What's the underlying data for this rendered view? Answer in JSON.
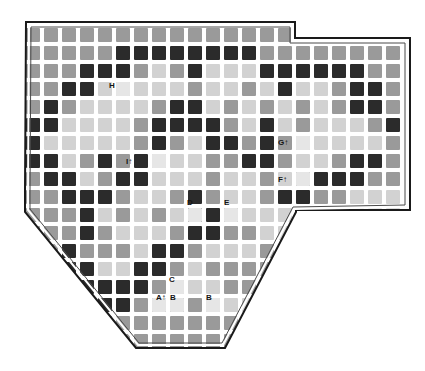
{
  "figure": {
    "name": "grid-map-diagram",
    "type": "checkerboard-grid-map",
    "background": "#ffffff",
    "border_color": "#1a1a1a",
    "cell_pitch": 18,
    "cell_size": 14,
    "origin": {
      "x": 26,
      "y": 28
    },
    "grid_cols": 21,
    "grid_rows": 18
  },
  "palette": {
    "light": "#d2d2d2",
    "medium": "#9a9a9a",
    "dark": "#2b2b2b",
    "void": "#ffffff",
    "label_text": "#151515",
    "outline": "#1a1a1a"
  },
  "legend_tones": [
    {
      "key": "light",
      "label": "light",
      "color": "#d2d2d2"
    },
    {
      "key": "medium",
      "label": "medium",
      "color": "#9a9a9a"
    },
    {
      "key": "dark",
      "label": "dark",
      "color": "#2b2b2b"
    }
  ],
  "boundary": {
    "name": "irregular-polygon-outline",
    "points": "26,22 295,22 295,38 410,38 410,210 296,210 296,212 225,348 136,348 25,212 25,192 26,22",
    "description": "Irregular plate: rectangular top-left block, stepped notch at top-right, diagonal cuts at bottom-left and bottom-right meeting a flat bottom edge."
  },
  "labels": [
    {
      "id": "H",
      "text": "H",
      "arrow": "",
      "col": 5,
      "row": 3,
      "x": 114,
      "y": 86
    },
    {
      "id": "I",
      "text": "I",
      "arrow": "↑",
      "col": 7,
      "row": 7,
      "x": 131,
      "y": 162
    },
    {
      "id": "G",
      "text": "G",
      "arrow": "↑",
      "col": 15,
      "row": 6,
      "x": 283,
      "y": 143
    },
    {
      "id": "F",
      "text": "F",
      "arrow": "↑",
      "col": 15,
      "row": 8,
      "x": 283,
      "y": 180
    },
    {
      "id": "D",
      "text": "D",
      "arrow": "",
      "col": 9,
      "row": 10,
      "x": 192,
      "y": 203
    },
    {
      "id": "E",
      "text": "E",
      "arrow": "",
      "col": 11,
      "row": 10,
      "x": 229,
      "y": 203
    },
    {
      "id": "C",
      "text": "C",
      "arrow": "",
      "col": 8,
      "row": 14,
      "x": 174,
      "y": 280
    },
    {
      "id": "A",
      "text": "A",
      "arrow": "↑",
      "col": 7,
      "row": 15,
      "x": 161,
      "y": 298
    },
    {
      "id": "B1",
      "text": "B",
      "arrow": "",
      "col": 8,
      "row": 15,
      "x": 175,
      "y": 298
    },
    {
      "id": "B2",
      "text": "B",
      "arrow": "",
      "col": 10,
      "row": 15,
      "x": 211,
      "y": 298
    }
  ],
  "grid_rows_tones": [
    "mmmmmmmmmmmmmmm......",
    "mmmmmddddddddmmmmmmmm",
    "mmmdddmlmdlllddddddmm",
    "mmddlllllmllmldllmddm",
    "mdmllllmddlmlmlmlmddm",
    "ddllllmddddmldlmlllmd",
    "dlllllmdmlddmdmlllllm",
    "ddlmdmdlllmmddmllmddm",
    "mddlmddlllmllmlmdddmm",
    "mmdddmllmdmllmddmmlll",
    "mmmdlmlmlddmlllmlllll",
    "mmmdmlllmddmmlllmmlll",
    "mmdmmmlddmlllmmmlllll",
    "mmddllddmlmmmmmllllll",
    "mmdddddmlllmmmmmllmll",
    "mmmdddmmmmlllllmmllll",
    "mmmmmmmmmmmmmmlllllll",
    "mmmmmmmmmmmmmmmmmmmmm"
  ]
}
